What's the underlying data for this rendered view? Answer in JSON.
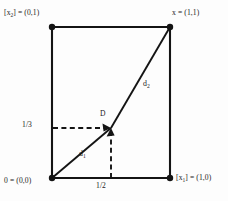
{
  "figure": {
    "kind": "geometry-diagram",
    "background_color": "#fdfdfd",
    "stroke_color": "#141414",
    "vertices": {
      "top_left": {
        "label_prefix": "[x",
        "label_sub": "2",
        "label_suffix": "] = (0,1)",
        "coord": [
          0,
          1
        ]
      },
      "top_right": {
        "label_prefix": "x",
        "label_sub": "",
        "label_suffix": " = (1,1)",
        "coord": [
          1,
          1
        ]
      },
      "bottom_left": {
        "label_prefix": "0",
        "label_sub": "",
        "label_suffix": " = (0,0)",
        "coord": [
          0,
          0
        ]
      },
      "bottom_right": {
        "label_prefix": "[x",
        "label_sub": "1",
        "label_suffix": "] = (1,0)",
        "coord": [
          1,
          0
        ]
      }
    },
    "interior_point": {
      "name": "D",
      "coord_x_label": "1/2",
      "coord_y_label": "1/3"
    },
    "segments": [
      {
        "name": "d1",
        "base": "d",
        "sub": "1",
        "from": "bottom_left",
        "to": "D"
      },
      {
        "name": "d2",
        "base": "d",
        "sub": "2",
        "from": "D",
        "to": "top_right"
      }
    ],
    "ticks": {
      "y_value": "1/3",
      "x_value": "1/2"
    }
  }
}
